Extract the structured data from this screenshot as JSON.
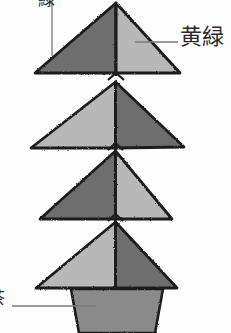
{
  "figure": {
    "kind": "botanical-color-diagram",
    "background_color": "#fdfdfd",
    "outline_color": "#1d1d1d",
    "dark_fill": "#6e6e6e",
    "light_fill": "#b8b8b8",
    "trunk_fill": "#8a8a8a",
    "leader_color": "#7a7a7a"
  },
  "labels": {
    "green": {
      "text": "緑",
      "meaning": "green",
      "clipped": "top"
    },
    "yellow_green": {
      "text": "黄緑",
      "meaning": "yellow-green",
      "clipped": "none"
    },
    "trunk": {
      "text": "茶",
      "meaning": "brown",
      "clipped": "left"
    }
  },
  "tiers": [
    {
      "index": 1,
      "left_half": "dark",
      "right_half": "light"
    },
    {
      "index": 2,
      "left_half": "light",
      "right_half": "dark"
    },
    {
      "index": 3,
      "left_half": "dark",
      "right_half": "light"
    },
    {
      "index": 4,
      "left_half": "light",
      "right_half": "dark"
    }
  ],
  "trunk": {
    "shape": "trapezoid",
    "fill": "#8a8a8a"
  }
}
